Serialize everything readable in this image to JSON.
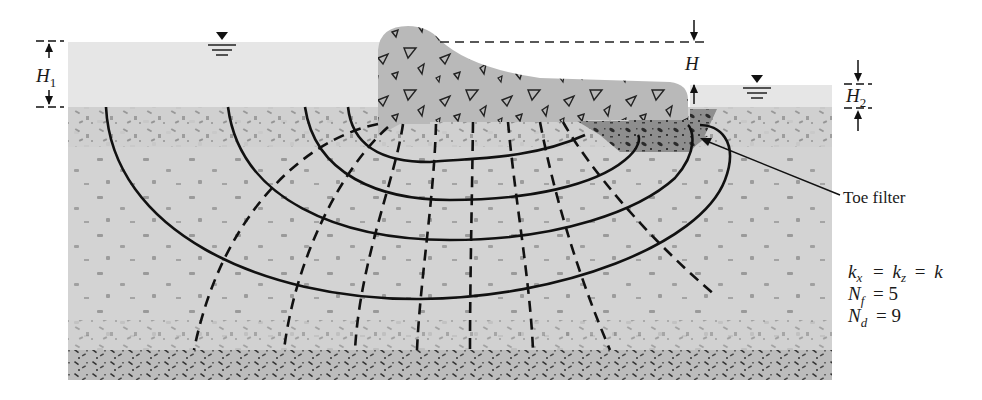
{
  "diagram": {
    "labels": {
      "h1": "H",
      "h1_sub": "1",
      "h": "H",
      "h2": "H",
      "h2_sub": "2",
      "toe_filter": "Toe filter"
    },
    "parameters": {
      "kx_k": "k",
      "kx_sub": "x",
      "eq1": "=",
      "kz_k": "k",
      "kz_sub": "z",
      "eq2": "=",
      "k": "k",
      "nf_n": "N",
      "nf_sub": "f",
      "nf_eq": "= 5",
      "nd_n": "N",
      "nd_sub": "d",
      "nd_eq": "= 9"
    },
    "values": {
      "Nf": 5,
      "Nd": 9
    },
    "colors": {
      "water": "#e6e6e6",
      "soil": "#d2d2d2",
      "dam": "#b8b8b8",
      "filter": "#8f8f8f",
      "bedrock": "#bdbdbd",
      "line": "#111111"
    }
  }
}
